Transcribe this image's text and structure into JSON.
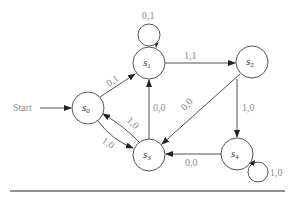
{
  "diagram": {
    "type": "finite-state-machine",
    "start_label": "Start",
    "start_state": "s0",
    "states": [
      {
        "id": "s0",
        "name": "s",
        "sub": "0",
        "cx": 88,
        "cy": 108
      },
      {
        "id": "s1",
        "name": "s",
        "sub": "1",
        "cx": 149,
        "cy": 63
      },
      {
        "id": "s2",
        "name": "s",
        "sub": "2",
        "cx": 252,
        "cy": 62
      },
      {
        "id": "s3",
        "name": "s",
        "sub": "3",
        "cx": 149,
        "cy": 155
      },
      {
        "id": "s4",
        "name": "s",
        "sub": "4",
        "cx": 237,
        "cy": 154
      }
    ],
    "transitions": [
      {
        "from": "s0",
        "to": "s1",
        "label": "0,1"
      },
      {
        "from": "s0",
        "to": "s3",
        "label": "1,0"
      },
      {
        "from": "s1",
        "to": "s1",
        "label": "0,1"
      },
      {
        "from": "s1",
        "to": "s2",
        "label": "1,1"
      },
      {
        "from": "s2",
        "to": "s3",
        "label": "0,0"
      },
      {
        "from": "s2",
        "to": "s4",
        "label": "1,0"
      },
      {
        "from": "s3",
        "to": "s1",
        "label": "0,0"
      },
      {
        "from": "s3",
        "to": "s0",
        "label": "1,0"
      },
      {
        "from": "s4",
        "to": "s3",
        "label": "0,0"
      },
      {
        "from": "s4",
        "to": "s4",
        "label": "1,0"
      }
    ]
  }
}
